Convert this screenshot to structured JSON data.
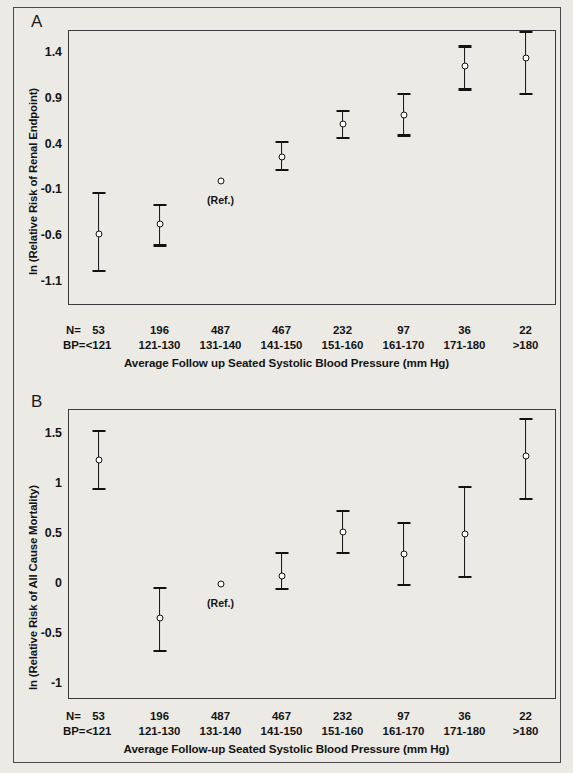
{
  "figure": {
    "background_color": "#eceae5",
    "line_color": "#121212"
  },
  "panels": [
    {
      "letter": "A",
      "ylabel": "ln (Relative Risk of Renal Endpoint)",
      "xlabel": "Average Follow up Seated Systolic Blood Pressure (mm Hg)",
      "yticks": [
        "1.4",
        "0.9",
        "0.4",
        "-0.1",
        "-0.6",
        "-1.1"
      ],
      "ref_label": "(Ref.)",
      "n_row_label": "N=",
      "bp_row_label": "BP="
    },
    {
      "letter": "B",
      "ylabel": "ln (Relative Risk of All Cause Mortality)",
      "xlabel": "Average Follow-up Seated Systolic Blood Pressure (mm Hg)",
      "yticks": [
        "1.5",
        "1.0",
        "0.5",
        "0.0",
        "-0.5",
        "-1.0"
      ],
      "ref_label": "(Ref.)",
      "n_row_label": "N=",
      "bp_row_label": "BP="
    }
  ],
  "chart_data": [
    {
      "type": "scatter",
      "panel": "A",
      "title": "",
      "ylabel": "ln (Relative Risk of Renal Endpoint)",
      "xlabel": "Average Follow up Seated Systolic Blood Pressure (mm Hg)",
      "ylim": [
        -1.35,
        1.65
      ],
      "yticks": [
        1.4,
        0.9,
        0.4,
        -0.1,
        -0.6,
        -1.1
      ],
      "grid": false,
      "legend": "none",
      "categories": [
        "<121",
        "121-130",
        "131-140",
        "141-150",
        "151-160",
        "161-170",
        "171-180",
        ">180"
      ],
      "n_values": [
        53,
        196,
        487,
        467,
        232,
        97,
        36,
        22
      ],
      "values": [
        -0.58,
        -0.47,
        0.0,
        0.27,
        0.62,
        0.72,
        1.26,
        1.35
      ],
      "ci_low": [
        -0.98,
        -0.7,
        null,
        0.12,
        0.47,
        0.5,
        1.0,
        0.95
      ],
      "ci_high": [
        -0.13,
        -0.26,
        null,
        0.43,
        0.77,
        0.95,
        1.47,
        1.63
      ],
      "reference_index": 2,
      "reference_label": "(Ref.)"
    },
    {
      "type": "scatter",
      "panel": "B",
      "title": "",
      "ylabel": "ln (Relative Risk of All Cause Mortality)",
      "xlabel": "Average Follow-up Seated Systolic Blood Pressure (mm Hg)",
      "ylim": [
        -1.15,
        1.75
      ],
      "yticks": [
        1.5,
        1.0,
        0.5,
        0.0,
        -0.5,
        -1.0
      ],
      "grid": false,
      "legend": "none",
      "categories": [
        "<121",
        "121-130",
        "131-140",
        "141-150",
        "151-160",
        "161-170",
        "171-180",
        ">180"
      ],
      "n_values": [
        53,
        196,
        487,
        467,
        232,
        97,
        36,
        22
      ],
      "values": [
        1.24,
        -0.34,
        0.0,
        0.08,
        0.52,
        0.3,
        0.5,
        1.28
      ],
      "ci_low": [
        0.95,
        -0.67,
        null,
        -0.05,
        0.31,
        -0.01,
        0.07,
        0.85
      ],
      "ci_high": [
        1.53,
        -0.04,
        null,
        0.31,
        0.73,
        0.61,
        0.97,
        1.65
      ],
      "reference_index": 2,
      "reference_label": "(Ref.)"
    }
  ]
}
